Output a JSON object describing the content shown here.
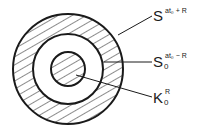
{
  "diagram": {
    "circles": {
      "center": [
        68,
        69
      ],
      "outer_radius": 55,
      "middle_radius": 35,
      "inner_radius": 17
    },
    "colors": {
      "stroke": "#1a1a1a",
      "hatch": "#1a1a1a",
      "background": "#ffffff"
    },
    "labels": [
      {
        "id": "outer",
        "base": "S",
        "sup": "at₀ + R",
        "sub": ""
      },
      {
        "id": "middle",
        "base": "S",
        "sup": "at₀ − R",
        "sub": "0"
      },
      {
        "id": "inner",
        "base": "K",
        "sup": "R",
        "sub": "0"
      }
    ]
  }
}
